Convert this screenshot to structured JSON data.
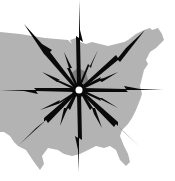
{
  "illustration": {
    "subject": "Lightning bolts radiating from central point over map of the United States",
    "colors": {
      "background": "#ffffff",
      "map_fill": "#b3b3b3",
      "map_shadow": "#7f7f7f",
      "bolt_fill": "#0a0a0a",
      "center_dot": "#ffffff"
    },
    "center": {
      "x": 79,
      "y": 90
    },
    "icons": [
      "us-map-silhouette",
      "lightning-bolt-rays",
      "center-dot"
    ]
  }
}
